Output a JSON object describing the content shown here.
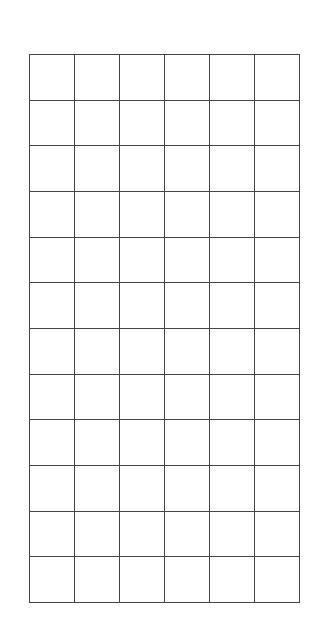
{
  "grid": {
    "rows": 12,
    "columns": 6,
    "line_color": "#444444",
    "background_color": "#ffffff",
    "cells": []
  }
}
